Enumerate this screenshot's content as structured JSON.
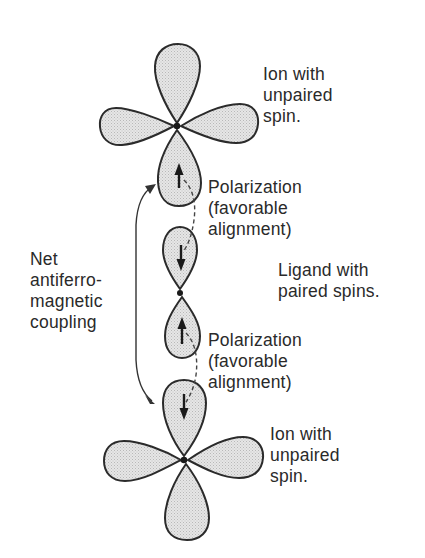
{
  "figure": {
    "type": "superexchange-diagram",
    "colors": {
      "lobe_fill": "#e2e2e2",
      "stroke": "#2b2b2b",
      "text": "#2a2a2a",
      "background": "#ffffff"
    }
  },
  "labels": {
    "top_ion": "Ion with\nunpaired\nspin.",
    "polarization_top": "Polarization\n(favorable\nalignment)",
    "ligand": "Ligand with\npaired spins.",
    "polarization_bottom": "Polarization\n(favorable\nalignment)",
    "bottom_ion": "Ion with\nunpaired\nspin.",
    "coupling": "Net\nantiferro-\nmagnetic\ncoupling"
  },
  "elements": {
    "top_ion": {
      "role": "metal ion d-orbital",
      "spin": "up"
    },
    "ligand_upper_lobe": {
      "spin": "down"
    },
    "ligand_lower_lobe": {
      "spin": "up"
    },
    "bottom_ion": {
      "role": "metal ion d-orbital",
      "spin": "down"
    },
    "coupling_arrow": {
      "type": "double-headed curved arrow"
    }
  }
}
